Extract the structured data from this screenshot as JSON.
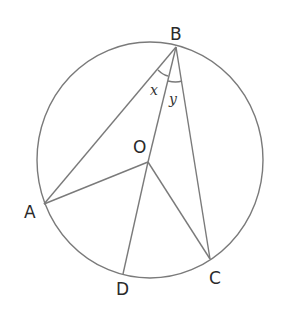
{
  "diagram": {
    "type": "circle-geometry",
    "circle": {
      "center_label": "O"
    },
    "points": {
      "A": {
        "label": "A"
      },
      "B": {
        "label": "B"
      },
      "C": {
        "label": "C"
      },
      "D": {
        "label": "D"
      },
      "O": {
        "label": "O"
      }
    },
    "segments": [
      "BA",
      "BO",
      "BC",
      "OA",
      "OD",
      "OC"
    ],
    "angles": {
      "x": {
        "label": "x",
        "at": "B",
        "between": [
          "BA",
          "BO"
        ]
      },
      "y": {
        "label": "y",
        "at": "B",
        "between": [
          "BO",
          "BC"
        ]
      }
    },
    "colors": {
      "line": "#7a7a7a",
      "text": "#2a2a2a"
    }
  }
}
